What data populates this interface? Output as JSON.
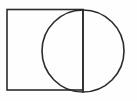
{
  "figure": {
    "background_color": "#fefefe",
    "stroke_color": "#2b2b2b",
    "stroke_width": 1.6,
    "canvas": {
      "width": 137,
      "height": 101
    },
    "shapes": [
      {
        "id": "rectangle",
        "name": "rectangle",
        "type": "rect",
        "x": 7,
        "y": 9.5,
        "width": 76,
        "height": 80.5,
        "label": "Rectangle"
      },
      {
        "id": "circle",
        "name": "circle",
        "type": "circle",
        "cx": 83,
        "cy": 51,
        "r": 41,
        "label": "Circle"
      },
      {
        "id": "vertical-diameter",
        "name": "vertical-diameter-line",
        "type": "line",
        "x1": 83,
        "y1": 10,
        "x2": 83,
        "y2": 92,
        "label": "Vertical diameter / shared edge"
      }
    ]
  }
}
